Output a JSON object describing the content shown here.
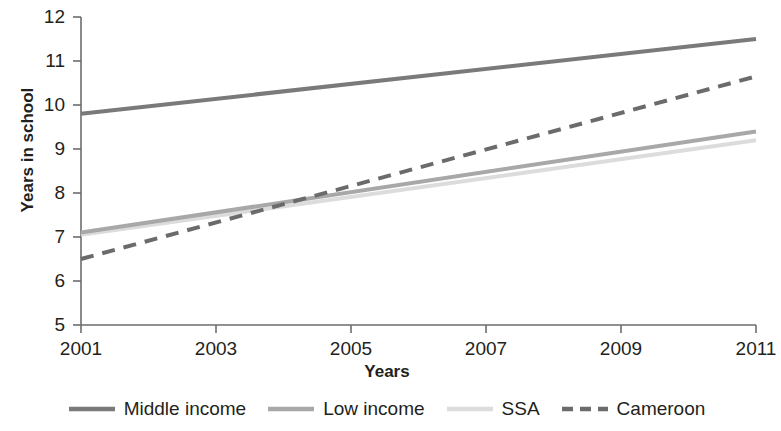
{
  "chart_data": {
    "type": "line",
    "title": "",
    "xlabel": "Years",
    "ylabel": "Years in school",
    "xlim": [
      2001,
      2011
    ],
    "ylim": [
      5,
      12
    ],
    "grid": false,
    "legend_position": "bottom",
    "x": [
      2001,
      2011
    ],
    "xticks": [
      "2001",
      "2003",
      "2005",
      "2007",
      "2009",
      "2011"
    ],
    "xtick_values": [
      2001,
      2003,
      2005,
      2007,
      2009,
      2011
    ],
    "yticks": [
      "5",
      "6",
      "7",
      "8",
      "9",
      "10",
      "11",
      "12"
    ],
    "ytick_values": [
      5,
      6,
      7,
      8,
      9,
      10,
      11,
      12
    ],
    "series": [
      {
        "name": "Middle income",
        "values": [
          9.8,
          11.5
        ],
        "color": "#7a7a7a",
        "style": "solid",
        "width": 4
      },
      {
        "name": "Low income",
        "values": [
          7.1,
          9.4
        ],
        "color": "#a8a8a8",
        "style": "solid",
        "width": 4
      },
      {
        "name": "SSA",
        "values": [
          7.05,
          9.2
        ],
        "color": "#dcdcdc",
        "style": "solid",
        "width": 4
      },
      {
        "name": "Cameroon",
        "values": [
          6.5,
          10.65
        ],
        "color": "#6b6b6b",
        "style": "dashed",
        "width": 4
      }
    ],
    "annotations": []
  },
  "axis": {
    "y_title": "Years in school",
    "x_title": "Years",
    "y_ticks": [
      "12",
      "11",
      "10",
      "9",
      "8",
      "7",
      "6",
      "5"
    ],
    "x_ticks": [
      "2001",
      "2003",
      "2005",
      "2007",
      "2009",
      "2011"
    ]
  },
  "legend": {
    "items": [
      {
        "label": "Middle income",
        "color": "#7a7a7a",
        "style": "solid"
      },
      {
        "label": "Low income",
        "color": "#a8a8a8",
        "style": "solid"
      },
      {
        "label": "SSA",
        "color": "#dcdcdc",
        "style": "solid"
      },
      {
        "label": "Cameroon",
        "color": "#6b6b6b",
        "style": "dashed"
      }
    ]
  }
}
